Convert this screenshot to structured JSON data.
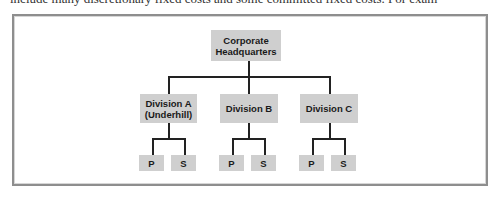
{
  "page": {
    "top_text": "include many discretionary fixed costs and some committed fixed costs. For exam"
  },
  "diagram": {
    "root": {
      "line1": "Corporate",
      "line2": "Headquarters"
    },
    "divisions": [
      {
        "line1": "Division A",
        "line2": "(Underhill)",
        "children": [
          "P",
          "S"
        ]
      },
      {
        "line1": "Division B",
        "line2": "",
        "children": [
          "P",
          "S"
        ]
      },
      {
        "line1": "Division C",
        "line2": "",
        "children": [
          "P",
          "S"
        ]
      }
    ],
    "colors": {
      "box_fill": "#cfcfcf",
      "connector": "#222222",
      "frame_border": "#8e8e8e"
    }
  }
}
